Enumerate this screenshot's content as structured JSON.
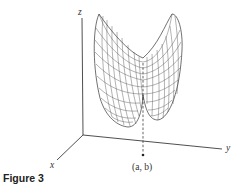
{
  "figure": {
    "caption": "Figure 3",
    "axes": {
      "x_label": "x",
      "y_label": "y",
      "z_label": "z"
    },
    "point_label": "(a, b)"
  }
}
